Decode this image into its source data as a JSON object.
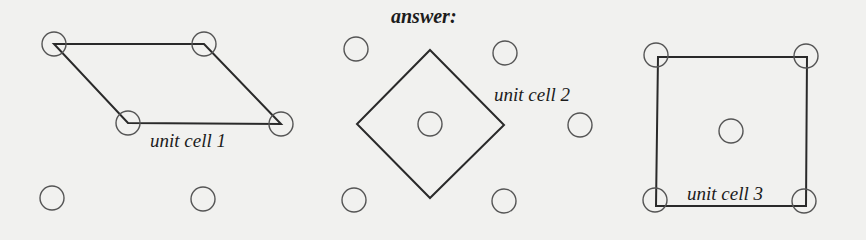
{
  "title": "answer:",
  "colors": {
    "background": "#f1f1ef",
    "stroke": "#2a2a2a",
    "circle": "#555555",
    "text": "#1c1c1c"
  },
  "lattice_points": [
    {
      "x": 54,
      "y": 44
    },
    {
      "x": 204,
      "y": 44
    },
    {
      "x": 356,
      "y": 49
    },
    {
      "x": 505,
      "y": 53
    },
    {
      "x": 656,
      "y": 55
    },
    {
      "x": 806,
      "y": 56
    },
    {
      "x": 128,
      "y": 123
    },
    {
      "x": 281,
      "y": 124
    },
    {
      "x": 430,
      "y": 124
    },
    {
      "x": 580,
      "y": 125
    },
    {
      "x": 731,
      "y": 131
    },
    {
      "x": 52,
      "y": 198
    },
    {
      "x": 203,
      "y": 199
    },
    {
      "x": 354,
      "y": 200
    },
    {
      "x": 504,
      "y": 201
    },
    {
      "x": 655,
      "y": 200
    },
    {
      "x": 804,
      "y": 201
    }
  ],
  "unit_cells": [
    {
      "label": "unit cell 1",
      "shape": "parallelogram",
      "points": "54,44 204,44 281,124 128,123",
      "label_pos": {
        "x": 150,
        "y": 131
      }
    },
    {
      "label": "unit cell 2",
      "shape": "diamond",
      "points": "430,50 504,125 430,198 357,124",
      "label_pos": {
        "x": 494,
        "y": 85
      }
    },
    {
      "label": "unit cell 3",
      "shape": "square",
      "points": "658,57 807,57 806,206 656,206",
      "label_pos": {
        "x": 687,
        "y": 184
      }
    }
  ]
}
